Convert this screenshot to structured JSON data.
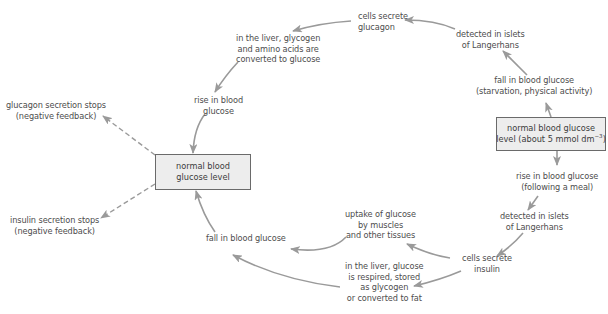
{
  "diagram": {
    "colors": {
      "arrow": "#9a9a9a",
      "box_fill": "#ededed",
      "box_border": "#6a6a6a",
      "text": "#4d4d4d"
    },
    "boxes": {
      "left": {
        "text": "normal blood\nglucose level"
      },
      "right": {
        "line1": "normal blood glucose",
        "line2_prefix": "level (about 5 mmol dm",
        "superscript": "−3",
        "line2_suffix": ")"
      }
    },
    "labels": {
      "cells_secrete_glucagon": "cells secrete\nglucagon",
      "detected_islets_top": "detected in islets\nof Langerhans",
      "fall_starvation": "fall in blood glucose\n(starvation, physical activity)",
      "liver_glycogen": "in the liver, glycogen\nand amino acids are\nconverted to glucose",
      "rise_in_blood_glucose": "rise in blood\nglucose",
      "glucagon_stops": "glucagon secretion stops\n(negative feedback)",
      "insulin_stops": "insulin secretion stops\n(negative feedback)",
      "rise_following_meal": "rise in blood glucose\n(following a meal)",
      "detected_islets_bottom": "detected in islets\nof Langerhans",
      "cells_secrete_insulin": "cells secrete\ninsulin",
      "uptake_glucose": "uptake of glucose\nby muscles\nand other tissues",
      "liver_glucose": "in the liver, glucose\nis respired, stored\nas glycogen\nor converted to fat",
      "fall_in_blood_glucose": "fall in blood glucose"
    },
    "edges": [
      {
        "from": "right_box",
        "to": "fall_starvation",
        "style": "solid"
      },
      {
        "from": "fall_starvation",
        "to": "detected_islets_top",
        "style": "solid"
      },
      {
        "from": "detected_islets_top",
        "to": "cells_secrete_glucagon",
        "style": "solid"
      },
      {
        "from": "cells_secrete_glucagon",
        "to": "liver_glycogen",
        "style": "solid"
      },
      {
        "from": "liver_glycogen",
        "to": "rise_in_blood_glucose",
        "style": "solid"
      },
      {
        "from": "rise_in_blood_glucose",
        "to": "left_box",
        "style": "solid"
      },
      {
        "from": "left_box",
        "to": "glucagon_stops",
        "style": "dashed"
      },
      {
        "from": "left_box",
        "to": "insulin_stops",
        "style": "dashed"
      },
      {
        "from": "right_box",
        "to": "rise_following_meal",
        "style": "solid"
      },
      {
        "from": "rise_following_meal",
        "to": "detected_islets_bottom",
        "style": "solid"
      },
      {
        "from": "detected_islets_bottom",
        "to": "cells_secrete_insulin",
        "style": "solid"
      },
      {
        "from": "cells_secrete_insulin",
        "to": "uptake_glucose",
        "style": "solid"
      },
      {
        "from": "cells_secrete_insulin",
        "to": "liver_glucose",
        "style": "solid"
      },
      {
        "from": "uptake_glucose",
        "to": "fall_in_blood_glucose",
        "style": "solid"
      },
      {
        "from": "liver_glucose",
        "to": "fall_in_blood_glucose",
        "style": "solid"
      },
      {
        "from": "fall_in_blood_glucose",
        "to": "left_box",
        "style": "solid"
      }
    ]
  }
}
